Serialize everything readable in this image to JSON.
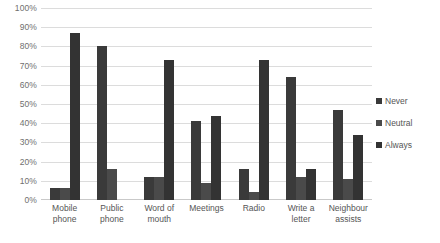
{
  "chart_data": {
    "type": "bar",
    "title": "",
    "subtitle": "",
    "xlabel": "",
    "ylabel": "",
    "ylim": [
      0,
      100
    ],
    "grid": true,
    "legend_position": "right",
    "categories": [
      "Mobile phone",
      "Public phone",
      "Word of mouth",
      "Meetings",
      "Radio",
      "Write a letter",
      "Neighbour assists"
    ],
    "category_lines": [
      [
        "Mobile",
        "phone"
      ],
      [
        "Public",
        "phone"
      ],
      [
        "Word of",
        "mouth"
      ],
      [
        "Meetings",
        ""
      ],
      [
        "Radio",
        ""
      ],
      [
        "Write a",
        "letter"
      ],
      [
        "Neighbour",
        "assists"
      ]
    ],
    "ytick_labels": [
      "100%",
      "90%",
      "80%",
      "70%",
      "60%",
      "50%",
      "40%",
      "30%",
      "20%",
      "10%",
      "0%"
    ],
    "ytick_values": [
      100,
      90,
      80,
      70,
      60,
      50,
      40,
      30,
      20,
      10,
      0
    ],
    "series": [
      {
        "name": "Never",
        "color": "#3a3a3a",
        "values": [
          6,
          80,
          12,
          41,
          16,
          64,
          47
        ]
      },
      {
        "name": "Neutral",
        "color": "#4a4a4a",
        "values": [
          6,
          16,
          12,
          9,
          4,
          12,
          11
        ]
      },
      {
        "name": "Always",
        "color": "#333333",
        "values": [
          87,
          0,
          73,
          44,
          73,
          16,
          34
        ]
      }
    ]
  },
  "legend": {
    "items": [
      {
        "label": "Never",
        "color": "#3a3a3a"
      },
      {
        "label": "Neutral",
        "color": "#4a4a4a"
      },
      {
        "label": "Always",
        "color": "#333333"
      }
    ]
  }
}
